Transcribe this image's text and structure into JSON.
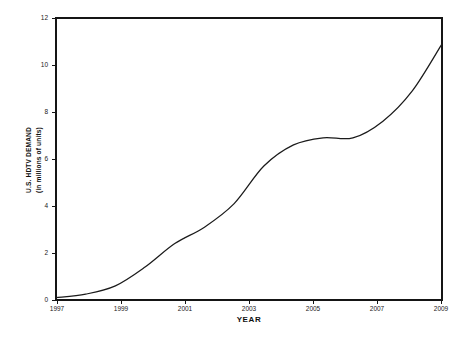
{
  "chart_data": {
    "type": "line",
    "title": "",
    "xlabel": "YEAR",
    "ylabel": "U.S. HDTV DEMAND (in millions of units)",
    "ylabel_lines": [
      "U.S. HDTV DEMAND",
      "(in millions of units)"
    ],
    "xlim": [
      1997,
      2010
    ],
    "ylim": [
      0,
      12
    ],
    "grid": false,
    "legend": false,
    "x_tick_labels": [
      "1997",
      "1999",
      "2001",
      "2003",
      "2005",
      "2007",
      "2009"
    ],
    "x_tick_values": [
      1997,
      1999,
      2001,
      2003,
      2005,
      2007,
      2009
    ],
    "y_tick_labels": [
      "0",
      "2",
      "4",
      "6",
      "8",
      "10",
      "12"
    ],
    "y_tick_values": [
      0,
      2,
      4,
      6,
      8,
      10,
      12
    ],
    "series": [
      {
        "name": "U.S. HDTV Demand",
        "color": "#1b1b1b",
        "x": [
          1997,
          1998,
          1999,
          2000,
          2001,
          2002,
          2003,
          2004,
          2005,
          2006,
          2007,
          2008,
          2009,
          2010
        ],
        "values": [
          0.1,
          0.25,
          0.6,
          1.4,
          2.4,
          3.1,
          4.1,
          5.7,
          6.6,
          6.9,
          6.9,
          7.6,
          8.9,
          10.9
        ]
      }
    ]
  },
  "axes": {
    "x_axis_title": "YEAR",
    "y_axis_title_line1": "U.S. HDTV DEMAND",
    "y_axis_title_line2": "(in millions of units)"
  }
}
